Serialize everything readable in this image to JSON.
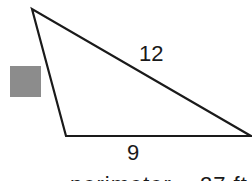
{
  "diagram": {
    "type": "triangle",
    "side_labels": {
      "hypotenuse": "12",
      "base": "9"
    },
    "unknown_marker_color": "#8c8c8c",
    "stroke_color": "#1a1a1a",
    "caption_partial": "perimeter = 27 ft"
  }
}
